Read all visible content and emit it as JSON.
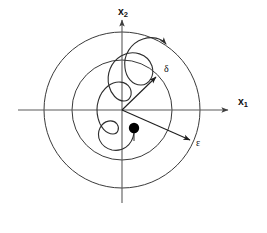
{
  "figure": {
    "background_color": "#ffffff",
    "width": 267,
    "height": 233
  },
  "axes": {
    "x_axis": {
      "label": "x",
      "subscript": "1",
      "icon": "arrow-right-icon",
      "from_x": 18,
      "to_x": 232,
      "y": 110,
      "color": "#5a5a5a"
    },
    "y_axis": {
      "label": "x",
      "subscript": "2",
      "icon": "arrow-up-icon",
      "from_y": 203,
      "to_y": 16,
      "x": 122,
      "color": "#5a5a5a"
    },
    "origin": {
      "x": 122,
      "y": 110
    }
  },
  "circles": [
    {
      "name": "delta-circle",
      "cx": 122,
      "cy": 110,
      "r": 50,
      "color": "#3a3a3a",
      "meaning": "inner circle of radius delta"
    },
    {
      "name": "epsilon-circle",
      "cx": 122,
      "cy": 110,
      "r": 78,
      "color": "#3a3a3a",
      "meaning": "outer circle of radius epsilon"
    }
  ],
  "vectors": [
    {
      "name": "delta-vector",
      "label": "δ",
      "from": [
        122,
        110
      ],
      "to": [
        158,
        75
      ],
      "icon": "arrow-head-icon",
      "color": "#1e1e1e"
    },
    {
      "name": "epsilon-vector",
      "label": "ε",
      "from": [
        122,
        110
      ],
      "to": [
        192,
        141
      ],
      "icon": "arrow-head-icon",
      "color": "#1e1e1e"
    }
  ],
  "trajectory": {
    "name": "state-trajectory",
    "color": "#2e2e2e",
    "direction_icon": "arrow-head-icon",
    "arrow_tip": [
      152,
      47
    ],
    "description": "wavy spiral trajectory starting at the initial-condition dot and remaining inside the epsilon circle"
  },
  "initial_condition": {
    "name": "initial-condition-dot",
    "cx": 134,
    "cy": 128,
    "r": 5.2,
    "color": "#000000"
  },
  "labels": {
    "x1": {
      "text": "x",
      "sub": "1"
    },
    "x2": {
      "text": "x",
      "sub": "2"
    },
    "delta": {
      "text": "δ"
    },
    "epsilon": {
      "text": "ε"
    }
  }
}
